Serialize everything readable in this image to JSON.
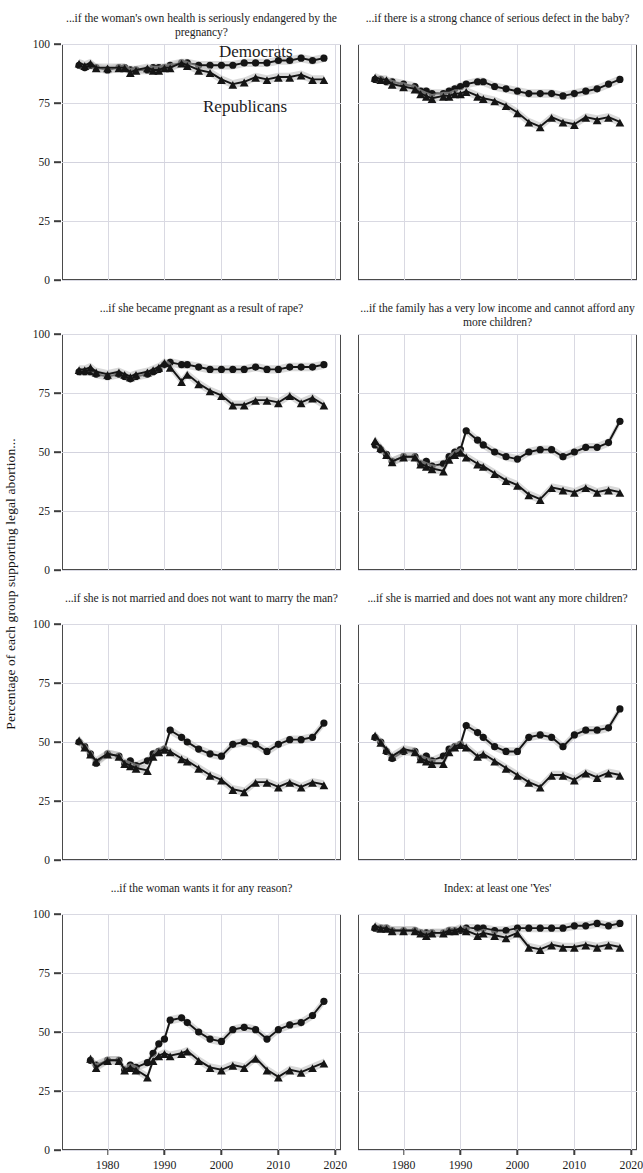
{
  "figure": {
    "ylabel": "Percentage of each group supporting legal abortion...",
    "legend": {
      "democrats": "Democrats",
      "republicans": "Republicans"
    },
    "colors": {
      "democrats": "#151515",
      "republicans": "#151515",
      "band": "#b9b9b9",
      "grid": "#d9d9e2",
      "frame": "#4a4a4a"
    }
  },
  "axes": {
    "yticks": [
      "0",
      "25",
      "50",
      "75",
      "100"
    ],
    "xticks": [
      "1980",
      "1990",
      "2000",
      "2010",
      "2020"
    ],
    "ylim": [
      0,
      100
    ],
    "xlim": [
      1972,
      2021
    ]
  },
  "chart_data": [
    {
      "type": "line",
      "title": "...if the woman's own health is seriously endangered by the pregnancy?",
      "xlabel": "",
      "ylabel": "Percentage of each group supporting legal abortion...",
      "ylim": [
        0,
        100
      ],
      "xlim": [
        1972,
        2021
      ],
      "grid": true,
      "legend_position": "panel-1-inside",
      "x": [
        1975,
        1976,
        1977,
        1978,
        1980,
        1982,
        1983,
        1984,
        1985,
        1987,
        1988,
        1989,
        1990,
        1991,
        1993,
        1994,
        1996,
        1998,
        2000,
        2002,
        2004,
        2006,
        2008,
        2010,
        2012,
        2014,
        2016,
        2018
      ],
      "series": [
        {
          "name": "Democrats",
          "marker": "circle",
          "values": [
            91,
            90,
            91,
            90,
            89,
            90,
            90,
            89,
            89,
            89,
            90,
            90,
            90,
            91,
            92,
            92,
            91,
            91,
            91,
            91,
            92,
            92,
            92,
            93,
            93,
            94,
            93,
            94
          ]
        },
        {
          "name": "Republicans",
          "marker": "triangle",
          "values": [
            92,
            91,
            92,
            90,
            90,
            90,
            90,
            88,
            89,
            90,
            89,
            89,
            90,
            90,
            92,
            91,
            89,
            88,
            85,
            83,
            84,
            86,
            85,
            86,
            86,
            87,
            85,
            85
          ]
        }
      ]
    },
    {
      "type": "line",
      "title": "...if there is a strong chance of serious defect in the baby?",
      "xlabel": "",
      "ylabel": "",
      "ylim": [
        0,
        100
      ],
      "xlim": [
        1972,
        2021
      ],
      "grid": true,
      "legend_position": "none",
      "x": [
        1975,
        1976,
        1977,
        1978,
        1980,
        1982,
        1983,
        1984,
        1985,
        1987,
        1988,
        1989,
        1990,
        1991,
        1993,
        1994,
        1996,
        1998,
        2000,
        2002,
        2004,
        2006,
        2008,
        2010,
        2012,
        2014,
        2016,
        2018
      ],
      "series": [
        {
          "name": "Democrats",
          "marker": "circle",
          "values": [
            85,
            85,
            84,
            84,
            83,
            82,
            80,
            80,
            79,
            79,
            80,
            81,
            82,
            83,
            84,
            84,
            82,
            81,
            80,
            79,
            79,
            79,
            78,
            79,
            80,
            81,
            83,
            85
          ]
        },
        {
          "name": "Republicans",
          "marker": "triangle",
          "values": [
            86,
            85,
            85,
            83,
            82,
            81,
            79,
            78,
            77,
            78,
            78,
            79,
            79,
            80,
            78,
            77,
            76,
            74,
            71,
            67,
            65,
            69,
            67,
            66,
            69,
            68,
            69,
            67
          ]
        }
      ]
    },
    {
      "type": "line",
      "title": "...if she became pregnant as a result of rape?",
      "xlabel": "",
      "ylabel": "",
      "ylim": [
        0,
        100
      ],
      "xlim": [
        1972,
        2021
      ],
      "grid": true,
      "legend_position": "none",
      "x": [
        1975,
        1976,
        1977,
        1978,
        1980,
        1982,
        1983,
        1984,
        1985,
        1987,
        1988,
        1989,
        1990,
        1991,
        1993,
        1994,
        1996,
        1998,
        2000,
        2002,
        2004,
        2006,
        2008,
        2010,
        2012,
        2014,
        2016,
        2018
      ],
      "series": [
        {
          "name": "Democrats",
          "marker": "circle",
          "values": [
            84,
            84,
            84,
            83,
            82,
            83,
            82,
            81,
            82,
            83,
            84,
            85,
            87,
            88,
            87,
            87,
            86,
            85,
            85,
            85,
            85,
            86,
            85,
            85,
            86,
            86,
            86,
            87
          ]
        },
        {
          "name": "Republicans",
          "marker": "triangle",
          "values": [
            85,
            85,
            86,
            84,
            83,
            84,
            83,
            82,
            83,
            84,
            85,
            86,
            88,
            86,
            80,
            83,
            79,
            76,
            74,
            70,
            70,
            72,
            72,
            71,
            74,
            71,
            73,
            70
          ]
        }
      ]
    },
    {
      "type": "line",
      "title": "...if the family has a very low income and cannot afford any more children?",
      "xlabel": "",
      "ylabel": "",
      "ylim": [
        0,
        100
      ],
      "xlim": [
        1972,
        2021
      ],
      "grid": true,
      "legend_position": "none",
      "x": [
        1975,
        1976,
        1977,
        1978,
        1980,
        1982,
        1983,
        1984,
        1985,
        1987,
        1988,
        1989,
        1990,
        1991,
        1993,
        1994,
        1996,
        1998,
        2000,
        2002,
        2004,
        2006,
        2008,
        2010,
        2012,
        2014,
        2016,
        2018
      ],
      "series": [
        {
          "name": "Democrats",
          "marker": "circle",
          "values": [
            53,
            51,
            49,
            46,
            48,
            48,
            45,
            46,
            44,
            45,
            48,
            50,
            51,
            59,
            55,
            53,
            50,
            48,
            47,
            50,
            51,
            51,
            48,
            50,
            52,
            52,
            54,
            63
          ]
        },
        {
          "name": "Republicans",
          "marker": "triangle",
          "values": [
            55,
            52,
            49,
            46,
            48,
            48,
            45,
            44,
            43,
            42,
            47,
            49,
            50,
            48,
            45,
            44,
            41,
            38,
            36,
            32,
            30,
            35,
            34,
            33,
            35,
            33,
            34,
            33
          ]
        }
      ]
    },
    {
      "type": "line",
      "title": "...if she is not married and does not want to marry the man?",
      "xlabel": "",
      "ylabel": "",
      "ylim": [
        0,
        100
      ],
      "xlim": [
        1972,
        2021
      ],
      "grid": true,
      "legend_position": "none",
      "x": [
        1975,
        1976,
        1977,
        1978,
        1980,
        1982,
        1983,
        1984,
        1985,
        1987,
        1988,
        1989,
        1990,
        1991,
        1993,
        1994,
        1996,
        1998,
        2000,
        2002,
        2004,
        2006,
        2008,
        2010,
        2012,
        2014,
        2016,
        2018
      ],
      "series": [
        {
          "name": "Democrats",
          "marker": "circle",
          "values": [
            50,
            48,
            45,
            41,
            45,
            44,
            41,
            42,
            40,
            42,
            45,
            46,
            47,
            55,
            52,
            50,
            47,
            45,
            44,
            49,
            50,
            49,
            46,
            49,
            51,
            51,
            52,
            58
          ]
        },
        {
          "name": "Republicans",
          "marker": "triangle",
          "values": [
            51,
            48,
            45,
            42,
            45,
            44,
            41,
            40,
            39,
            38,
            44,
            46,
            47,
            46,
            43,
            42,
            39,
            36,
            34,
            30,
            29,
            33,
            33,
            31,
            33,
            31,
            33,
            32
          ]
        }
      ]
    },
    {
      "type": "line",
      "title": "...if she is married and does not want any more children?",
      "xlabel": "",
      "ylabel": "",
      "ylim": [
        0,
        100
      ],
      "xlim": [
        1972,
        2021
      ],
      "grid": true,
      "legend_position": "none",
      "x": [
        1975,
        1976,
        1977,
        1978,
        1980,
        1982,
        1983,
        1984,
        1985,
        1987,
        1988,
        1989,
        1990,
        1991,
        1993,
        1994,
        1996,
        1998,
        2000,
        2002,
        2004,
        2006,
        2008,
        2010,
        2012,
        2014,
        2016,
        2018
      ],
      "series": [
        {
          "name": "Democrats",
          "marker": "circle",
          "values": [
            52,
            50,
            46,
            43,
            46,
            46,
            43,
            44,
            42,
            44,
            47,
            48,
            49,
            57,
            54,
            52,
            48,
            46,
            46,
            52,
            53,
            52,
            48,
            53,
            55,
            55,
            56,
            64
          ]
        },
        {
          "name": "Republicans",
          "marker": "triangle",
          "values": [
            53,
            50,
            47,
            44,
            47,
            46,
            43,
            42,
            41,
            41,
            46,
            48,
            49,
            48,
            44,
            45,
            42,
            39,
            36,
            33,
            31,
            36,
            36,
            34,
            37,
            35,
            37,
            36
          ]
        }
      ]
    },
    {
      "type": "line",
      "title": "...if the woman wants it for any reason?",
      "xlabel": "",
      "ylabel": "",
      "ylim": [
        0,
        100
      ],
      "xlim": [
        1972,
        2021
      ],
      "grid": true,
      "legend_position": "none",
      "x": [
        1977,
        1978,
        1980,
        1982,
        1983,
        1984,
        1985,
        1987,
        1988,
        1989,
        1990,
        1991,
        1993,
        1994,
        1996,
        1998,
        2000,
        2002,
        2004,
        2006,
        2008,
        2010,
        2012,
        2014,
        2016,
        2018
      ],
      "series": [
        {
          "name": "Democrats",
          "marker": "circle",
          "values": [
            38,
            36,
            38,
            38,
            34,
            36,
            35,
            37,
            41,
            45,
            47,
            55,
            56,
            54,
            50,
            47,
            46,
            51,
            52,
            51,
            47,
            51,
            53,
            54,
            57,
            63
          ]
        },
        {
          "name": "Republicans",
          "marker": "triangle",
          "values": [
            39,
            35,
            38,
            38,
            34,
            35,
            34,
            31,
            38,
            40,
            41,
            40,
            41,
            42,
            38,
            35,
            34,
            36,
            35,
            39,
            34,
            31,
            34,
            33,
            35,
            37
          ]
        }
      ]
    },
    {
      "type": "line",
      "title": "Index: at least one 'Yes'",
      "xlabel": "",
      "ylabel": "",
      "ylim": [
        0,
        100
      ],
      "xlim": [
        1972,
        2021
      ],
      "grid": true,
      "legend_position": "none",
      "x": [
        1975,
        1976,
        1977,
        1978,
        1980,
        1982,
        1983,
        1984,
        1985,
        1987,
        1988,
        1989,
        1990,
        1991,
        1993,
        1994,
        1996,
        1998,
        2000,
        2002,
        2004,
        2006,
        2008,
        2010,
        2012,
        2014,
        2016,
        2018
      ],
      "series": [
        {
          "name": "Democrats",
          "marker": "circle",
          "values": [
            94,
            94,
            94,
            93,
            93,
            93,
            92,
            92,
            92,
            92,
            93,
            93,
            93,
            94,
            94,
            94,
            93,
            93,
            94,
            94,
            94,
            94,
            94,
            95,
            95,
            96,
            95,
            96
          ]
        },
        {
          "name": "Republicans",
          "marker": "triangle",
          "values": [
            95,
            94,
            94,
            93,
            93,
            93,
            92,
            91,
            92,
            92,
            93,
            93,
            94,
            93,
            91,
            92,
            91,
            90,
            92,
            86,
            85,
            87,
            86,
            86,
            87,
            86,
            87,
            86
          ]
        }
      ]
    }
  ]
}
